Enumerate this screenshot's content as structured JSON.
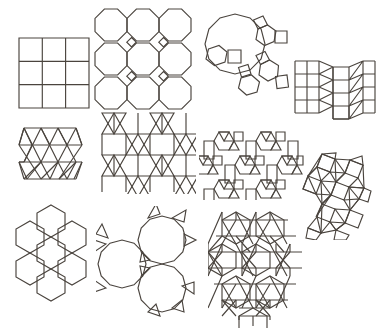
{
  "page": {
    "background_color": "#ffffff",
    "stroke_color": "#4a443e",
    "width": 378,
    "height": 334
  },
  "figures": [
    {
      "id": "square-tiling",
      "name": "square-tiling",
      "vertex_config": "4.4.4.4",
      "label": "Square tiling",
      "shapes": [
        "square"
      ],
      "grid": "3 by 3 squares",
      "x": 18,
      "y": 37,
      "w": 72,
      "h": 72
    },
    {
      "id": "truncated-square-tiling",
      "name": "truncated-square-tiling",
      "vertex_config": "4.8.8",
      "label": "Truncated square tiling",
      "shapes": [
        "octagon",
        "square"
      ],
      "grid": "3 by 3 octagons with interstitial squares",
      "x": 94,
      "y": 8,
      "w": 96,
      "h": 100
    },
    {
      "id": "truncated-hexagonal-cluster",
      "name": "truncated-hexagonal-cluster",
      "vertex_config": "4.6.12",
      "label": "Dodecagon, hexagon and square cluster",
      "shapes": [
        "dodecagon",
        "hexagon",
        "square"
      ],
      "grid": "one dodecagon with radiating hexagons and squares",
      "x": 203,
      "y": 8,
      "w": 85,
      "h": 105
    },
    {
      "id": "elongated-triangular-tiling",
      "name": "elongated-triangular-tiling",
      "vertex_config": "3.3.3.4.4",
      "label": "Elongated triangular tiling",
      "shapes": [
        "square",
        "triangle"
      ],
      "grid": "rows of squares alternating with rows of triangles",
      "x": 293,
      "y": 55,
      "w": 82,
      "h": 72
    },
    {
      "id": "triangular-tiling",
      "name": "triangular-tiling",
      "vertex_config": "3.3.3.3.3.3",
      "label": "Triangular tiling",
      "shapes": [
        "triangle"
      ],
      "grid": "hexagonal patch of equilateral triangles",
      "x": 18,
      "y": 120,
      "w": 74,
      "h": 74
    },
    {
      "id": "star-triangle-tiling",
      "name": "star-triangle-tiling",
      "vertex_config": "3.6.3.6",
      "label": "Six pointed star and triangle tiling",
      "shapes": [
        "triangle",
        "hexagram"
      ],
      "grid": "lattice of overlapping triangles forming stars",
      "x": 96,
      "y": 112,
      "w": 98,
      "h": 80
    },
    {
      "id": "rhombitrihexagonal-tiling",
      "name": "rhombitrihexagonal-tiling",
      "vertex_config": "3.4.6.4",
      "label": "Rhombitrihexagonal tiling",
      "shapes": [
        "hexagon",
        "square",
        "triangle"
      ],
      "grid": "hexagons ringed by squares and triangles",
      "x": 199,
      "y": 126,
      "w": 104,
      "h": 72
    },
    {
      "id": "snub-square-tiling",
      "name": "snub-square-tiling",
      "vertex_config": "3.3.4.3.4",
      "label": "Snub square tiling",
      "shapes": [
        "square",
        "triangle"
      ],
      "grid": "pinwheel of squares and triangles",
      "x": 302,
      "y": 152,
      "w": 68,
      "h": 86
    },
    {
      "id": "hexagonal-tiling",
      "name": "hexagonal-tiling",
      "vertex_config": "6.6.6",
      "label": "Hexagonal tiling",
      "shapes": [
        "hexagon"
      ],
      "grid": "seven hexagon flower patch",
      "x": 10,
      "y": 203,
      "w": 80,
      "h": 104
    },
    {
      "id": "truncated-hexagonal-tiling",
      "name": "truncated-hexagonal-tiling",
      "vertex_config": "3.12.12",
      "label": "Truncated hexagonal tiling",
      "shapes": [
        "dodecagon",
        "triangle"
      ],
      "grid": "three dodecagons with triangles between",
      "x": 96,
      "y": 206,
      "w": 106,
      "h": 110
    },
    {
      "id": "trihexagonal-triangle-tiling",
      "name": "trihexagonal-triangle-tiling",
      "vertex_config": "3.3.3.3.6",
      "label": "Hexagon and triangle tiling",
      "shapes": [
        "hexagon",
        "triangle"
      ],
      "grid": "hexagonal patch of hexagons and triangles",
      "x": 208,
      "y": 208,
      "w": 92,
      "h": 118
    }
  ]
}
